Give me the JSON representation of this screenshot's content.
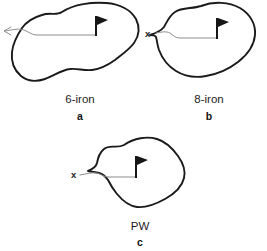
{
  "figure": {
    "background_color": "#ffffff",
    "outline_color": "#1a1a1a",
    "trajectory_color": "#8d8d8d",
    "flag_color": "#161616",
    "text_color": "#1d1d1d",
    "panels": [
      {
        "id": "panel-a",
        "club_label": "6-iron",
        "letter_label": "a",
        "start_marker": "arrow-left",
        "start_marker_text": "",
        "flag_name": "golf-flag-icon"
      },
      {
        "id": "panel-b",
        "club_label": "8-iron",
        "letter_label": "b",
        "start_marker": "x-label",
        "start_marker_text": "x",
        "flag_name": "golf-flag-icon"
      },
      {
        "id": "panel-c",
        "club_label": "PW",
        "letter_label": "c",
        "start_marker": "x-label",
        "start_marker_text": "x",
        "flag_name": "golf-flag-icon"
      }
    ]
  }
}
